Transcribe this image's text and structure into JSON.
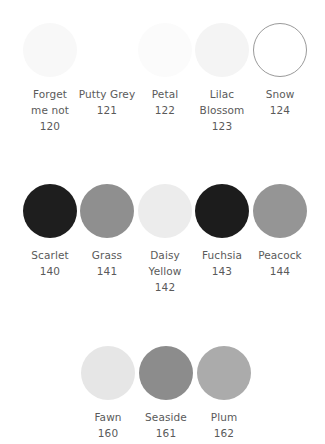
{
  "rows": [
    {
      "top": 23,
      "swatches": [
        {
          "name_lines": [
            "Forget",
            "me not"
          ],
          "code": "120",
          "color": "#f8f8f8",
          "border": "none",
          "cx": 50
        },
        {
          "name_lines": [
            "Putty Grey"
          ],
          "code": "121",
          "color": "#ffffff",
          "border": "none",
          "cx": 107
        },
        {
          "name_lines": [
            "Petal"
          ],
          "code": "122",
          "color": "#fbfbfb",
          "border": "none",
          "cx": 165
        },
        {
          "name_lines": [
            "Lilac",
            "Blossom"
          ],
          "code": "123",
          "color": "#f4f4f4",
          "border": "none",
          "cx": 222
        },
        {
          "name_lines": [
            "Snow"
          ],
          "code": "124",
          "color": "#ffffff",
          "border": "1px solid #9a9a9a",
          "cx": 280
        }
      ]
    },
    {
      "top": 184,
      "swatches": [
        {
          "name_lines": [
            "Scarlet"
          ],
          "code": "140",
          "color": "#1e1e1e",
          "border": "none",
          "cx": 50
        },
        {
          "name_lines": [
            "Grass"
          ],
          "code": "141",
          "color": "#8f8f8f",
          "border": "none",
          "cx": 107
        },
        {
          "name_lines": [
            "Daisy",
            "Yellow"
          ],
          "code": "142",
          "color": "#ececec",
          "border": "none",
          "cx": 165
        },
        {
          "name_lines": [
            "Fuchsia"
          ],
          "code": "143",
          "color": "#1c1c1c",
          "border": "none",
          "cx": 222
        },
        {
          "name_lines": [
            "Peacock"
          ],
          "code": "144",
          "color": "#959595",
          "border": "none",
          "cx": 280
        }
      ]
    },
    {
      "top": 346,
      "swatches": [
        {
          "name_lines": [
            "Fawn"
          ],
          "code": "160",
          "color": "#e6e6e6",
          "border": "none",
          "cx": 108
        },
        {
          "name_lines": [
            "Seaside"
          ],
          "code": "161",
          "color": "#8c8c8c",
          "border": "none",
          "cx": 166
        },
        {
          "name_lines": [
            "Plum"
          ],
          "code": "162",
          "color": "#ababab",
          "border": "none",
          "cx": 224
        }
      ]
    }
  ]
}
